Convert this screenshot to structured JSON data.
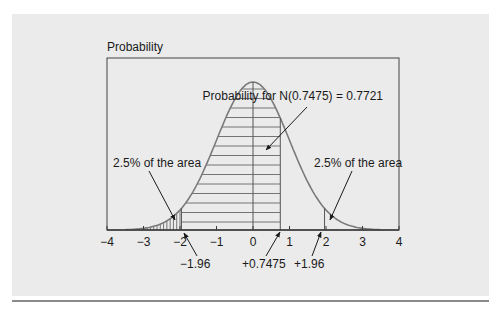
{
  "chart_data": {
    "type": "area",
    "title": "",
    "ylabel": "Probability",
    "xlabel": "",
    "xlim": [
      -4,
      4
    ],
    "x_ticks": [
      -4,
      -3,
      -2,
      -1,
      0,
      1,
      2,
      3,
      4
    ],
    "x_tick_labels": [
      "−4",
      "−3",
      "−2",
      "−1",
      "0",
      "1",
      "2",
      "3",
      "4"
    ],
    "curve": "standard normal density N(0,1)",
    "shaded_regions": [
      {
        "name": "left tail",
        "from": -4,
        "to": -1.96,
        "pattern": "vertical hatching",
        "area": 0.025
      },
      {
        "name": "cumulative to z",
        "from": -1.96,
        "to": 0.7475,
        "pattern": "horizontal hatching"
      }
    ],
    "reference_lines": [
      -1.96,
      0,
      0.7475,
      1.96
    ],
    "annotations": [
      {
        "text": "Probability for N(0.7475) = 0.7721",
        "points_to": "central shaded area"
      },
      {
        "text": "2.5% of the area",
        "points_to": "left tail"
      },
      {
        "text": "2.5% of the area",
        "points_to": "right tail"
      },
      {
        "text": "−1.96",
        "points_to": "x=-1.96"
      },
      {
        "text": "+0.7475",
        "points_to": "x=0.7475"
      },
      {
        "text": "+1.96",
        "points_to": "x=1.96"
      }
    ],
    "grid": false,
    "legend": null
  },
  "labels": {
    "ylabel": "Probability",
    "main_annotation": "Probability for N(0.7475) = 0.7721",
    "left_tail": "2.5% of the area",
    "right_tail": "2.5% of the area",
    "z_neg": "−1.96",
    "z_val": "+0.7475",
    "z_pos": "+1.96"
  },
  "ticks": [
    "−4",
    "−3",
    "−2",
    "−1",
    "0",
    "1",
    "2",
    "3",
    "4"
  ],
  "colors": {
    "panel": "#ebebeb",
    "curve": "#7a7a7a",
    "axis": "#3a3a3a",
    "hatch": "#555555"
  }
}
